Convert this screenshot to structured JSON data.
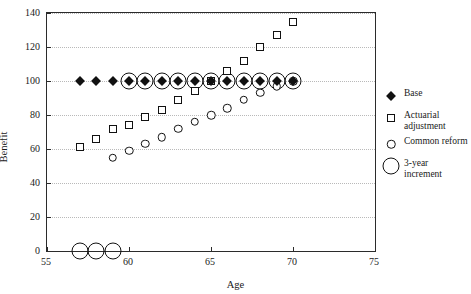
{
  "chart_data": {
    "type": "scatter",
    "title": "",
    "xlabel": "Age",
    "ylabel": "Benefit",
    "xlim": [
      55,
      75
    ],
    "ylim": [
      0,
      140
    ],
    "xticks": [
      55,
      60,
      65,
      70,
      75
    ],
    "yticks": [
      0,
      20,
      40,
      60,
      80,
      100,
      120,
      140
    ],
    "grid": true,
    "grid_style": "dotted horizontal",
    "legend_position": "right",
    "series": [
      {
        "name": "Base",
        "marker": "filled-diamond",
        "x": [
          57,
          58,
          59,
          60,
          61,
          62,
          63,
          64,
          65,
          66,
          67,
          68,
          69,
          70
        ],
        "y": [
          100,
          100,
          100,
          100,
          100,
          100,
          100,
          100,
          100,
          100,
          100,
          100,
          100,
          100
        ]
      },
      {
        "name": "Actuarial adjustment",
        "marker": "open-square",
        "x": [
          57,
          58,
          59,
          60,
          61,
          62,
          63,
          64,
          65,
          66,
          67,
          68,
          69,
          70
        ],
        "y": [
          61,
          66,
          72,
          74,
          79,
          83,
          89,
          94,
          100,
          106,
          112,
          120,
          127,
          135
        ]
      },
      {
        "name": "Common reform",
        "marker": "open-circle",
        "x": [
          59,
          60,
          61,
          62,
          63,
          64,
          65,
          66,
          67,
          68,
          69,
          70
        ],
        "y": [
          55,
          59,
          63,
          67,
          72,
          76,
          80,
          84,
          89,
          93,
          97,
          100
        ]
      },
      {
        "name": "3-year increment",
        "marker": "large-ring",
        "x": [
          57,
          58,
          59,
          60,
          61,
          62,
          63,
          64,
          65,
          66,
          67,
          68,
          69,
          70
        ],
        "y": [
          0,
          0,
          0,
          100,
          100,
          100,
          100,
          100,
          100,
          100,
          100,
          100,
          100,
          100
        ],
        "note": "Ring drawn around each age from 57 to 70; rings at 57-59 sit on the x-axis baseline"
      }
    ],
    "legend": [
      {
        "label": "Base",
        "marker": "filled-diamond"
      },
      {
        "label": "Actuarial adjustment",
        "marker": "open-square"
      },
      {
        "label": "Common reform",
        "marker": "open-circle"
      },
      {
        "label": "3-year increment",
        "marker": "large-ring"
      }
    ]
  }
}
